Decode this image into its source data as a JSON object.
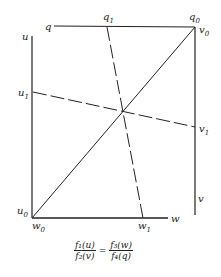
{
  "diagram": {
    "type": "nomogram",
    "labels": {
      "q": "q",
      "q0": "q",
      "q0_sub": "0",
      "q1": "q",
      "q1_sub": "1",
      "u": "u",
      "u0": "u",
      "u0_sub": "0",
      "u1": "u",
      "u1_sub": "1",
      "v": "v",
      "v0": "v",
      "v0_sub": "0",
      "v1": "v",
      "v1_sub": "1",
      "w": "w",
      "w0": "w",
      "w0_sub": "0",
      "w1": "w",
      "w1_sub": "1"
    },
    "formula": {
      "lhs_num": "f₁(u)",
      "lhs_den": "f₂(v)",
      "equals": "=",
      "rhs_num": "f₃(w)",
      "rhs_den": "f₄(q)"
    },
    "line_color": "#222222"
  }
}
